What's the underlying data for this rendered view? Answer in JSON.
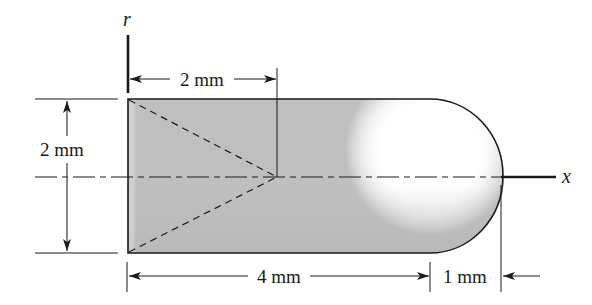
{
  "diagram": {
    "axes": {
      "r_label": "r",
      "x_label": "x"
    },
    "dimensions": {
      "cone_depth": "2 mm",
      "radius": "2 mm",
      "cylinder_length": "4 mm",
      "cap_length": "1 mm"
    },
    "colors": {
      "line": "#1a1a1a",
      "fill_light": "#ffffff",
      "fill_shade": "#c8c8c8"
    }
  }
}
